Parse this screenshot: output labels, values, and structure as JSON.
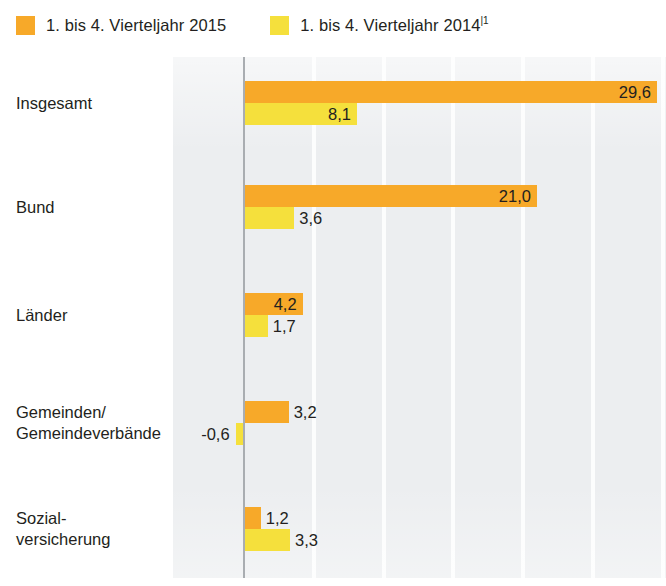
{
  "legend": {
    "entries": [
      {
        "label": "1. bis 4. Vierteljahr 2015",
        "footnote": "",
        "color": "#f7a929",
        "name": "series-2015"
      },
      {
        "label": "1. bis 4. Vierteljahr 2014",
        "footnote": "1",
        "color": "#f5e03c",
        "name": "series-2014"
      }
    ]
  },
  "colors": {
    "series_2015": "#f7a929",
    "series_2014": "#f5e03c",
    "plot_background": "#eceef0",
    "gridline": "#fdfdfd",
    "zero_axis": "#a9adb1",
    "text": "#231f20"
  },
  "chart_data": {
    "type": "bar",
    "orientation": "horizontal",
    "title": "",
    "subtitle": "",
    "xlabel": "",
    "ylabel": "",
    "grid": true,
    "legend_position": "top-left",
    "categories": [
      "Insgesamt",
      "Bund",
      "Länder",
      "Gemeinden/\nGemeindeverbände",
      "Sozial-\nversicherung"
    ],
    "category_lines": [
      [
        "Insgesamt"
      ],
      [
        "Bund"
      ],
      [
        "Länder"
      ],
      [
        "Gemeinden/",
        "Gemeindeverbände"
      ],
      [
        "Sozial-",
        "versicherung"
      ]
    ],
    "series": [
      {
        "name": "1. bis 4. Vierteljahr 2015",
        "color": "#f7a929",
        "values": [
          29.6,
          21.0,
          4.2,
          3.2,
          1.2
        ],
        "labels": [
          "29,6",
          "21,0",
          "4,2",
          "3,2",
          "1,2"
        ]
      },
      {
        "name": "1. bis 4. Vierteljahr 2014",
        "color": "#f5e03c",
        "values": [
          8.1,
          3.6,
          1.7,
          -0.6,
          3.3
        ],
        "labels": [
          "8,1",
          "3,6",
          "1,7",
          "-0,6",
          "3,3"
        ]
      }
    ],
    "xlim": [
      -5.1,
      30.2
    ],
    "xticks": [
      0,
      5,
      10,
      15,
      20,
      25,
      30
    ],
    "value_label_decimal_separator": ","
  }
}
